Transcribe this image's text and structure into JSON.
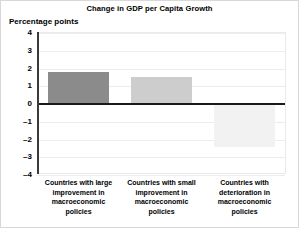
{
  "chart_data": {
    "type": "bar",
    "title": "Change in GDP per Capita Growth",
    "ylabel": "Percentage points",
    "xlabel": "",
    "categories": [
      "Countries with large improvement in macroeconomic policies",
      "Countries with small improvement in macroeconomic policies",
      "Countries with deterioration in macroeconomic policies"
    ],
    "values": [
      1.8,
      1.5,
      -2.4
    ],
    "ylim": [
      -4,
      4
    ],
    "yticks": [
      4,
      3,
      2,
      1,
      0,
      -1,
      -2,
      -3,
      -4
    ],
    "ytick_labels": [
      "4",
      "3",
      "2",
      "1",
      "0",
      "–1",
      "–2",
      "–3",
      "–4"
    ],
    "grid": true,
    "legend": "none",
    "bar_colors": [
      "#8b8b8b",
      "#cdcdcd",
      "#f2f2f2"
    ],
    "zero_line_color": "#1a1a1a",
    "gridline_color": "#ededed",
    "axis_color": "#3a3a3a"
  }
}
